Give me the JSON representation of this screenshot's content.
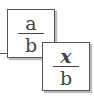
{
  "fractions": [
    {
      "numerator": "a",
      "denominator": "b"
    },
    {
      "numerator": "x",
      "denominator": "b"
    }
  ]
}
